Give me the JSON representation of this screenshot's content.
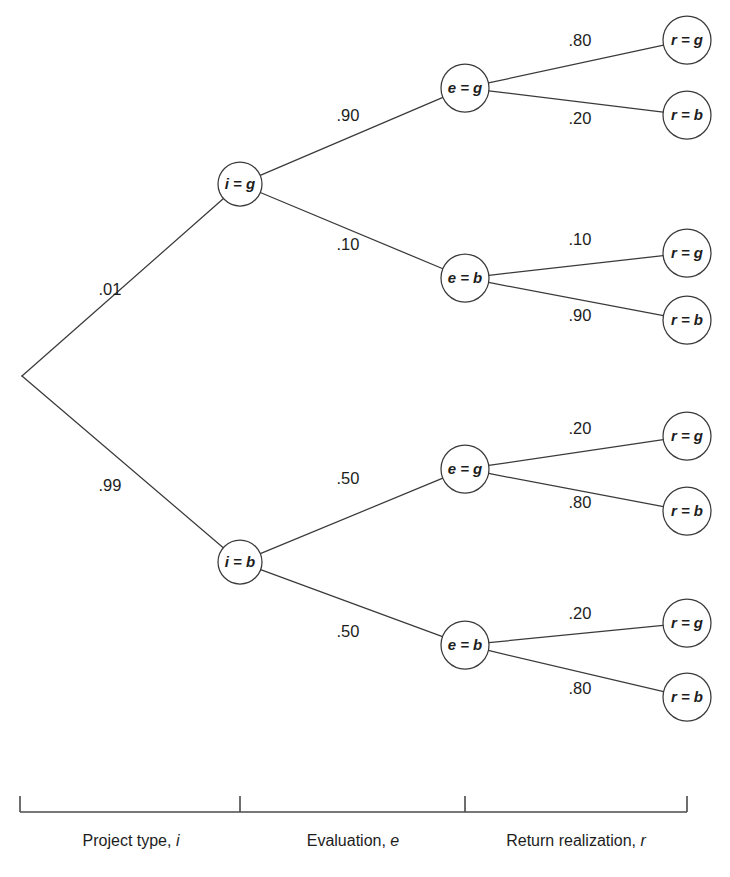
{
  "figure": {
    "type": "probability-tree",
    "width": 730,
    "height": 877,
    "background": "#ffffff",
    "line_color": "#3a3a3a",
    "text_color": "#1d1d1d"
  },
  "chart_data": {
    "type": "diagram",
    "subtype": "probability-tree",
    "title": "",
    "stages": [
      "Project type, i",
      "Evaluation, e",
      "Return realization, r"
    ],
    "root": {
      "label": "",
      "x": 22,
      "y": 376
    },
    "nodes": [
      {
        "id": "i_g",
        "label": "i = g",
        "x": 240,
        "y": 184,
        "r": 22,
        "stage": 1
      },
      {
        "id": "i_b",
        "label": "i = b",
        "x": 240,
        "y": 562,
        "r": 22,
        "stage": 1
      },
      {
        "id": "e_g_1",
        "label": "e = g",
        "x": 465,
        "y": 88,
        "r": 24,
        "stage": 2
      },
      {
        "id": "e_b_1",
        "label": "e = b",
        "x": 465,
        "y": 278,
        "r": 24,
        "stage": 2
      },
      {
        "id": "e_g_2",
        "label": "e = g",
        "x": 465,
        "y": 469,
        "r": 24,
        "stage": 2
      },
      {
        "id": "e_b_2",
        "label": "e = b",
        "x": 465,
        "y": 645,
        "r": 24,
        "stage": 2
      },
      {
        "id": "r_g_1",
        "label": "r = g",
        "x": 687,
        "y": 40,
        "r": 24,
        "stage": 3
      },
      {
        "id": "r_b_1",
        "label": "r = b",
        "x": 687,
        "y": 115,
        "r": 24,
        "stage": 3
      },
      {
        "id": "r_g_2",
        "label": "r = g",
        "x": 687,
        "y": 253,
        "r": 24,
        "stage": 3
      },
      {
        "id": "r_b_2",
        "label": "r = b",
        "x": 687,
        "y": 320,
        "r": 24,
        "stage": 3
      },
      {
        "id": "r_g_3",
        "label": "r = g",
        "x": 687,
        "y": 436,
        "r": 24,
        "stage": 3
      },
      {
        "id": "r_b_3",
        "label": "r = b",
        "x": 687,
        "y": 511,
        "r": 24,
        "stage": 3
      },
      {
        "id": "r_g_4",
        "label": "r = g",
        "x": 687,
        "y": 623,
        "r": 24,
        "stage": 3
      },
      {
        "id": "r_b_4",
        "label": "r = b",
        "x": 687,
        "y": 697,
        "r": 24,
        "stage": 3
      }
    ],
    "edges": [
      {
        "from": "root",
        "to": "i_g",
        "probability": ".01",
        "label_x": 110,
        "label_y": 291
      },
      {
        "from": "root",
        "to": "i_b",
        "probability": ".99",
        "label_x": 110,
        "label_y": 487
      },
      {
        "from": "i_g",
        "to": "e_g_1",
        "probability": ".90",
        "label_x": 348,
        "label_y": 117
      },
      {
        "from": "i_g",
        "to": "e_b_1",
        "probability": ".10",
        "label_x": 348,
        "label_y": 246
      },
      {
        "from": "i_b",
        "to": "e_g_2",
        "probability": ".50",
        "label_x": 348,
        "label_y": 480
      },
      {
        "from": "i_b",
        "to": "e_b_2",
        "probability": ".50",
        "label_x": 348,
        "label_y": 633
      },
      {
        "from": "e_g_1",
        "to": "r_g_1",
        "probability": ".80",
        "label_x": 580,
        "label_y": 42
      },
      {
        "from": "e_g_1",
        "to": "r_b_1",
        "probability": ".20",
        "label_x": 580,
        "label_y": 120
      },
      {
        "from": "e_b_1",
        "to": "r_g_2",
        "probability": ".10",
        "label_x": 580,
        "label_y": 241
      },
      {
        "from": "e_b_1",
        "to": "r_b_2",
        "probability": ".90",
        "label_x": 580,
        "label_y": 317
      },
      {
        "from": "e_g_2",
        "to": "r_g_3",
        "probability": ".20",
        "label_x": 580,
        "label_y": 430
      },
      {
        "from": "e_g_2",
        "to": "r_b_3",
        "probability": ".80",
        "label_x": 580,
        "label_y": 504
      },
      {
        "from": "e_b_2",
        "to": "r_g_4",
        "probability": ".20",
        "label_x": 580,
        "label_y": 615
      },
      {
        "from": "e_b_2",
        "to": "r_b_4",
        "probability": ".80",
        "label_x": 580,
        "label_y": 690
      }
    ],
    "annotations": []
  },
  "nodes": {
    "i_g": "i = g",
    "i_b": "i = b",
    "e_g_1": "e = g",
    "e_b_1": "e = b",
    "e_g_2": "e = g",
    "e_b_2": "e = b",
    "r_g_1": "r = g",
    "r_b_1": "r = b",
    "r_g_2": "r = g",
    "r_b_2": "r = b",
    "r_g_3": "r = g",
    "r_b_3": "r = b",
    "r_g_4": "r = g",
    "r_b_4": "r = b"
  },
  "probabilities": {
    "root_to_i_g": ".01",
    "root_to_i_b": ".99",
    "i_g_to_e_g": ".90",
    "i_g_to_e_b": ".10",
    "i_b_to_e_g": ".50",
    "i_b_to_e_b": ".50",
    "e_g_1_to_r_g": ".80",
    "e_g_1_to_r_b": ".20",
    "e_b_1_to_r_g": ".10",
    "e_b_1_to_r_b": ".90",
    "e_g_2_to_r_g": ".20",
    "e_g_2_to_r_b": ".80",
    "e_b_2_to_r_g": ".20",
    "e_b_2_to_r_b": ".80"
  },
  "axis": {
    "line_y": 812,
    "x_start": 20,
    "x_tick_1": 240,
    "x_tick_2": 465,
    "x_end": 687,
    "tick_height": 16,
    "labels": [
      {
        "text": "Project type,",
        "var": "i",
        "x": 131,
        "y": 842
      },
      {
        "text": "Evaluation,",
        "var": "e",
        "x": 353,
        "y": 842
      },
      {
        "text": "Return realization,",
        "var": "r",
        "x": 576,
        "y": 842
      }
    ]
  }
}
